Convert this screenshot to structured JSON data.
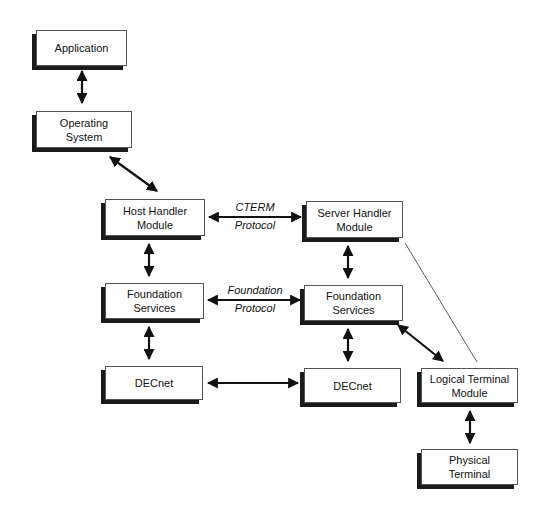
{
  "diagram": {
    "nodes": {
      "application": {
        "line1": "Application",
        "line2": ""
      },
      "operating_system": {
        "line1": "Operating",
        "line2": "System"
      },
      "host_handler": {
        "line1": "Host Handler",
        "line2": "Module"
      },
      "server_handler": {
        "line1": "Server Handler",
        "line2": "Module"
      },
      "foundation_left": {
        "line1": "Foundation",
        "line2": "Services"
      },
      "foundation_right": {
        "line1": "Foundation",
        "line2": "Services"
      },
      "decnet_left": {
        "line1": "DECnet",
        "line2": ""
      },
      "decnet_right": {
        "line1": "DECnet",
        "line2": ""
      },
      "logical_terminal": {
        "line1": "Logical Terminal",
        "line2": "Module"
      },
      "physical_terminal": {
        "line1": "Physical",
        "line2": "Terminal"
      }
    },
    "edge_labels": {
      "cterm": {
        "line1": "CTERM",
        "line2": "Protocol"
      },
      "foundation": {
        "line1": "Foundation",
        "line2": "Protocol"
      }
    },
    "edges": [
      {
        "from": "Application",
        "to": "Operating System",
        "type": "bidirectional"
      },
      {
        "from": "Operating System",
        "to": "Host Handler Module",
        "type": "bidirectional"
      },
      {
        "from": "Host Handler Module",
        "to": "Server Handler Module",
        "type": "bidirectional",
        "label": "CTERM Protocol"
      },
      {
        "from": "Host Handler Module",
        "to": "Foundation Services (left)",
        "type": "bidirectional"
      },
      {
        "from": "Server Handler Module",
        "to": "Foundation Services (right)",
        "type": "bidirectional"
      },
      {
        "from": "Foundation Services (left)",
        "to": "Foundation Services (right)",
        "type": "bidirectional",
        "label": "Foundation Protocol"
      },
      {
        "from": "Foundation Services (left)",
        "to": "DECnet (left)",
        "type": "bidirectional"
      },
      {
        "from": "Foundation Services (right)",
        "to": "DECnet (right)",
        "type": "bidirectional"
      },
      {
        "from": "DECnet (left)",
        "to": "DECnet (right)",
        "type": "bidirectional"
      },
      {
        "from": "Foundation Services (right)",
        "to": "Logical Terminal Module",
        "type": "bidirectional"
      },
      {
        "from": "Server Handler Module",
        "to": "Logical Terminal Module",
        "type": "line"
      },
      {
        "from": "Logical Terminal Module",
        "to": "Physical Terminal",
        "type": "bidirectional"
      }
    ],
    "colors": {
      "ink": "#111111",
      "shadow": "#1a1a1a",
      "background": "#ffffff"
    }
  }
}
